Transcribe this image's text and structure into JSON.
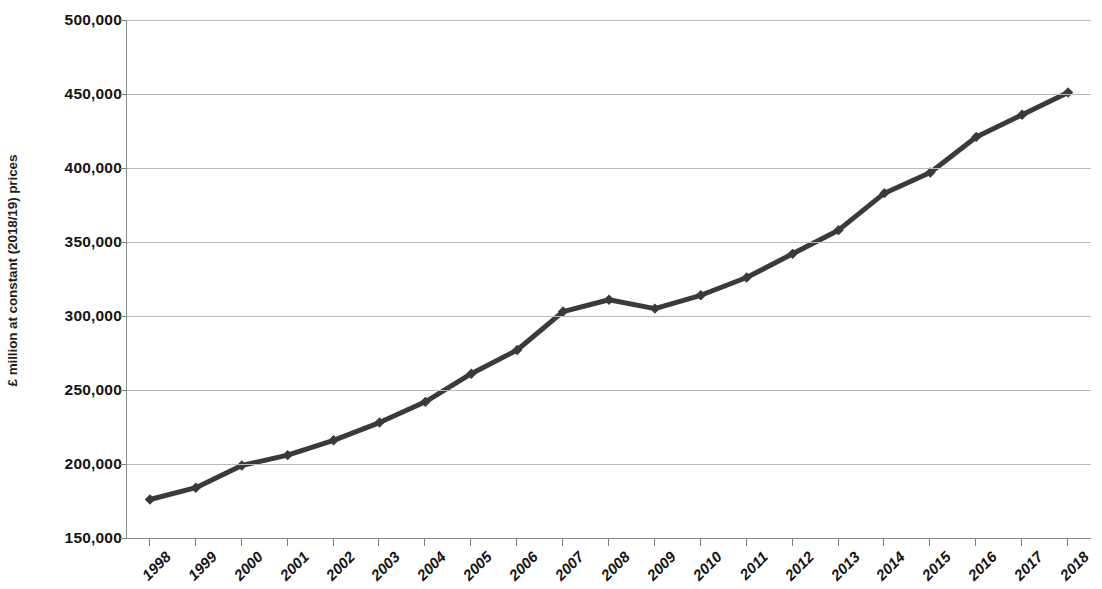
{
  "chart_data": {
    "type": "line",
    "title": "",
    "subtitle": "",
    "xlabel": "",
    "ylabel": "£ million at constant (2018/19) prices",
    "categories": [
      "1998",
      "1999",
      "2000",
      "2001",
      "2002",
      "2003",
      "2004",
      "2005",
      "2006",
      "2007",
      "2008",
      "2009",
      "2010",
      "2011",
      "2012",
      "2013",
      "2014",
      "2015",
      "2016",
      "2017",
      "2018"
    ],
    "values": [
      176000,
      184000,
      199000,
      206000,
      216000,
      228000,
      242000,
      261000,
      277000,
      303000,
      311000,
      305000,
      314000,
      326000,
      342000,
      358000,
      383000,
      397000,
      421000,
      436000,
      451000
    ],
    "ylim": [
      150000,
      500000
    ],
    "y_ticks": [
      150000,
      200000,
      250000,
      300000,
      350000,
      400000,
      450000,
      500000
    ],
    "y_tick_labels": [
      "150,000",
      "200,000",
      "250,000",
      "300,000",
      "350,000",
      "400,000",
      "450,000",
      "500,000"
    ],
    "grid": true,
    "legend": false,
    "legend_position": "none",
    "marker": "diamond",
    "series_color": "#3a3a3a",
    "gridline_color": "#b9b9b9",
    "axis_color": "#8d8d8d",
    "line_width": 5
  },
  "axes": {
    "y_title": "£ million at constant (2018/19) prices"
  }
}
